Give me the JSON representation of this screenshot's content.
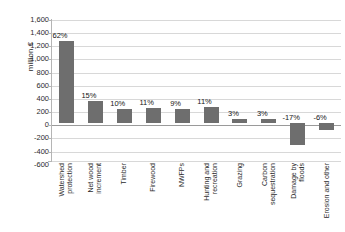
{
  "chart_data": {
    "type": "bar",
    "title": "",
    "xlabel": "",
    "ylabel": "million €",
    "ylim": [
      -600,
      1600
    ],
    "ytick_step": 200,
    "yticks": [
      "1,600",
      "1,400",
      "1,200",
      "1,000",
      "800",
      "600",
      "400",
      "200",
      "0",
      "-200",
      "-400",
      "-600"
    ],
    "ytick_values": [
      1600,
      1400,
      1200,
      1000,
      800,
      600,
      400,
      200,
      0,
      -200,
      -400,
      -600
    ],
    "grid": true,
    "legend": "none",
    "bar_color": "#6e6e6e",
    "categories": [
      "Watershed protection",
      "Net wood increment",
      "Timber",
      "Firewood",
      "NWFPs",
      "Hunting and recreation",
      "Grazing",
      "Carbon sequestration",
      "Damage by floods",
      "Erosion and other"
    ],
    "category_lines": [
      [
        "Watershed",
        "protection"
      ],
      [
        "Net wood",
        "increment"
      ],
      [
        "Timber"
      ],
      [
        "Firewood"
      ],
      [
        "NWFPs"
      ],
      [
        "Hunting and",
        "recreation"
      ],
      [
        "Grazing"
      ],
      [
        "Carbon",
        "sequestration"
      ],
      [
        "Damage by",
        "floods"
      ],
      [
        "Erosion and other"
      ]
    ],
    "values": [
      1280,
      330,
      210,
      230,
      205,
      250,
      60,
      60,
      -350,
      -120
    ],
    "data_labels": [
      "62%",
      "15%",
      "10%",
      "11%",
      "9%",
      "11%",
      "3%",
      "3%",
      "-17%",
      "-6%"
    ],
    "percentages": [
      62,
      15,
      10,
      11,
      9,
      11,
      3,
      3,
      -17,
      -6
    ]
  }
}
